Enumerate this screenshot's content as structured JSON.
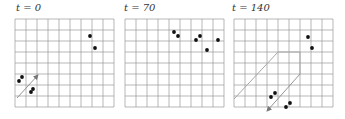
{
  "figure": {
    "grid": {
      "cols": 9,
      "rows": 8,
      "cell": 11,
      "line_color": "#9a9a9a",
      "shape_color": "#a8a8a8",
      "dot_color": "#111111"
    },
    "panels": [
      {
        "title": "t = 0",
        "origin_x": 15,
        "origin_y": 19,
        "dots": [
          [
            90,
            36
          ],
          [
            95,
            48
          ],
          [
            22,
            77
          ],
          [
            19,
            81
          ],
          [
            33,
            89
          ],
          [
            31,
            92
          ]
        ],
        "paths": [],
        "arrows": [
          [
            [
              17,
              98
            ],
            [
              38,
              75
            ]
          ]
        ]
      },
      {
        "title": "t = 70",
        "origin_x": 125,
        "origin_y": 19,
        "dots": [
          [
            174,
            32
          ],
          [
            178,
            36
          ],
          [
            196,
            40
          ],
          [
            200,
            36
          ],
          [
            218,
            40
          ],
          [
            207,
            50
          ]
        ],
        "paths": [],
        "arrows": []
      },
      {
        "title": "t = 140",
        "origin_x": 234,
        "origin_y": 19,
        "dots": [
          [
            308,
            37
          ],
          [
            312,
            48
          ],
          [
            275,
            93
          ],
          [
            271,
            97
          ],
          [
            290,
            103
          ],
          [
            286,
            107
          ]
        ],
        "paths": [
          [
            [
              234,
              99
            ],
            [
              278,
              52
            ],
            [
              300,
              52
            ],
            [
              300,
              74
            ]
          ]
        ],
        "arrows": [
          [
            [
              300,
              74
            ],
            [
              267,
              111
            ]
          ]
        ]
      }
    ]
  }
}
